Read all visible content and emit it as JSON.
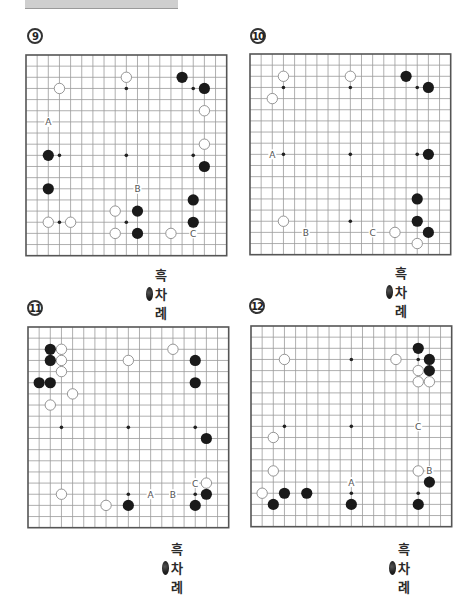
{
  "banner": {
    "text": ""
  },
  "board_style": {
    "line_color": "#9a9a9a",
    "border_color": "#555555",
    "black_stone": "#1a1a1a",
    "white_stone": "#ffffff",
    "white_outline": "#8a8a8a",
    "label_color": "#555555",
    "size": 19
  },
  "legend_text": "흑차례",
  "problems": [
    {
      "number": "9",
      "legend": "흑차례",
      "black": [
        [
          14,
          2
        ],
        [
          16,
          3
        ],
        [
          2,
          9
        ],
        [
          16,
          10
        ],
        [
          2,
          12
        ],
        [
          15,
          13
        ],
        [
          10,
          14
        ],
        [
          15,
          15
        ],
        [
          10,
          16
        ]
      ],
      "white": [
        [
          3,
          3
        ],
        [
          9,
          2
        ],
        [
          16,
          5
        ],
        [
          16,
          8
        ],
        [
          8,
          14
        ],
        [
          2,
          15
        ],
        [
          4,
          15
        ],
        [
          8,
          16
        ],
        [
          13,
          16
        ]
      ],
      "labels": [
        {
          "t": "A",
          "c": 2,
          "r": 6
        },
        {
          "t": "B",
          "c": 10,
          "r": 12
        },
        {
          "t": "C",
          "c": 15,
          "r": 16
        }
      ]
    },
    {
      "number": "10",
      "legend": "흑차례",
      "black": [
        [
          14,
          2
        ],
        [
          16,
          3
        ],
        [
          16,
          9
        ],
        [
          15,
          13
        ],
        [
          15,
          15
        ],
        [
          16,
          16
        ]
      ],
      "white": [
        [
          3,
          2
        ],
        [
          9,
          2
        ],
        [
          2,
          4
        ],
        [
          3,
          15
        ],
        [
          13,
          16
        ],
        [
          15,
          17
        ]
      ],
      "labels": [
        {
          "t": "A",
          "c": 2,
          "r": 9
        },
        {
          "t": "B",
          "c": 5,
          "r": 16
        },
        {
          "t": "C",
          "c": 11,
          "r": 16
        }
      ]
    },
    {
      "number": "11",
      "legend": "흑차례",
      "black": [
        [
          2,
          2
        ],
        [
          2,
          3
        ],
        [
          15,
          3
        ],
        [
          1,
          5
        ],
        [
          2,
          5
        ],
        [
          15,
          5
        ],
        [
          16,
          10
        ],
        [
          16,
          15
        ],
        [
          9,
          16
        ],
        [
          15,
          16
        ]
      ],
      "white": [
        [
          3,
          2
        ],
        [
          3,
          3
        ],
        [
          9,
          3
        ],
        [
          13,
          2
        ],
        [
          3,
          4
        ],
        [
          4,
          6
        ],
        [
          2,
          7
        ],
        [
          16,
          14
        ],
        [
          3,
          15
        ],
        [
          7,
          16
        ]
      ],
      "labels": [
        {
          "t": "C",
          "c": 15,
          "r": 14
        },
        {
          "t": "A",
          "c": 11,
          "r": 15
        },
        {
          "t": "B",
          "c": 13,
          "r": 15
        }
      ]
    },
    {
      "number": "12",
      "legend": "흑차례",
      "black": [
        [
          15,
          2
        ],
        [
          16,
          3
        ],
        [
          16,
          4
        ],
        [
          16,
          14
        ],
        [
          3,
          15
        ],
        [
          5,
          15
        ],
        [
          2,
          16
        ],
        [
          9,
          16
        ],
        [
          15,
          16
        ]
      ],
      "white": [
        [
          3,
          3
        ],
        [
          13,
          3
        ],
        [
          15,
          4
        ],
        [
          15,
          5
        ],
        [
          16,
          5
        ],
        [
          2,
          10
        ],
        [
          2,
          13
        ],
        [
          15,
          13
        ],
        [
          1,
          15
        ]
      ],
      "labels": [
        {
          "t": "C",
          "c": 15,
          "r": 9
        },
        {
          "t": "B",
          "c": 16,
          "r": 13
        },
        {
          "t": "A",
          "c": 9,
          "r": 14
        }
      ]
    }
  ]
}
